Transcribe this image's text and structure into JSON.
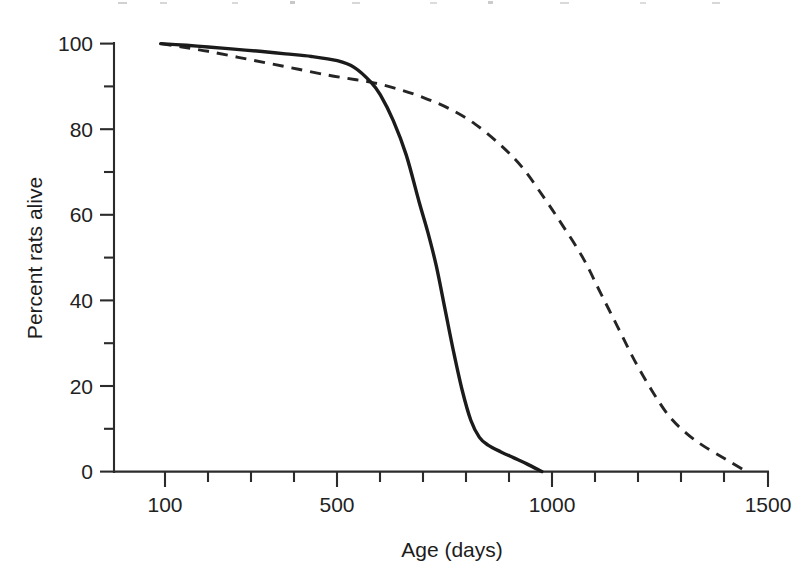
{
  "figure": {
    "background_color": "#ffffff",
    "ink_color": "#1b1b1b"
  },
  "axes": {
    "x": {
      "title": "Age (days)",
      "tick_labels": [
        "100",
        "500",
        "1000",
        "1500"
      ],
      "tick_values": [
        100,
        500,
        1000,
        1500
      ],
      "minor_tick_values": [
        200,
        300,
        400,
        600,
        700,
        800,
        900,
        1100,
        1200,
        1300,
        1400
      ],
      "range": [
        60,
        1540
      ]
    },
    "y": {
      "title": "Percent rats alive",
      "tick_labels": [
        "0",
        "20",
        "40",
        "60",
        "80",
        "100"
      ],
      "tick_values": [
        0,
        20,
        40,
        60,
        80,
        100
      ],
      "minor_tick_values": [
        10,
        30,
        50,
        70,
        90
      ],
      "range": [
        0,
        100
      ]
    }
  },
  "chart_data": {
    "type": "line",
    "title": "",
    "subtitle": "",
    "xlabel": "Age (days)",
    "ylabel": "Percent rats alive",
    "xlim": [
      60,
      1540
    ],
    "ylim": [
      0,
      100
    ],
    "grid": false,
    "legend": "none",
    "axis_scale": "linear",
    "series": [
      {
        "name": "solid-curve",
        "style": "solid",
        "color": "#1b1b1b",
        "x": [
          90,
          150,
          200,
          260,
          320,
          380,
          440,
          500,
          540,
          578,
          600,
          630,
          660,
          690,
          710,
          730,
          750,
          770,
          790,
          810,
          830,
          850,
          880,
          910,
          940,
          975
        ],
        "y": [
          100,
          99.6,
          99.2,
          98.7,
          98.2,
          97.6,
          97.0,
          96.0,
          94.4,
          91.0,
          88.0,
          82.0,
          74.0,
          63.0,
          56.0,
          48.0,
          38.0,
          28.0,
          19.0,
          12.0,
          8.0,
          6.2,
          4.6,
          3.2,
          1.8,
          0.0
        ]
      },
      {
        "name": "dashed-curve",
        "style": "dashed",
        "color": "#252525",
        "x": [
          90,
          140,
          200,
          270,
          340,
          410,
          480,
          540,
          578,
          640,
          700,
          760,
          820,
          880,
          930,
          980,
          1020,
          1070,
          1110,
          1150,
          1190,
          1230,
          1270,
          1310,
          1350,
          1400,
          1450
        ],
        "y": [
          100,
          99.2,
          98.2,
          96.8,
          95.4,
          94.0,
          92.6,
          91.6,
          91.0,
          89.4,
          87.4,
          84.8,
          81.2,
          76.2,
          71.0,
          64.0,
          58.0,
          50.0,
          42.0,
          34.0,
          26.0,
          19.0,
          13.0,
          9.0,
          6.0,
          3.0,
          0.0
        ]
      }
    ],
    "annotations": [
      {
        "text": "curves cross",
        "x": 578,
        "y": 91,
        "rendered": false
      }
    ]
  }
}
